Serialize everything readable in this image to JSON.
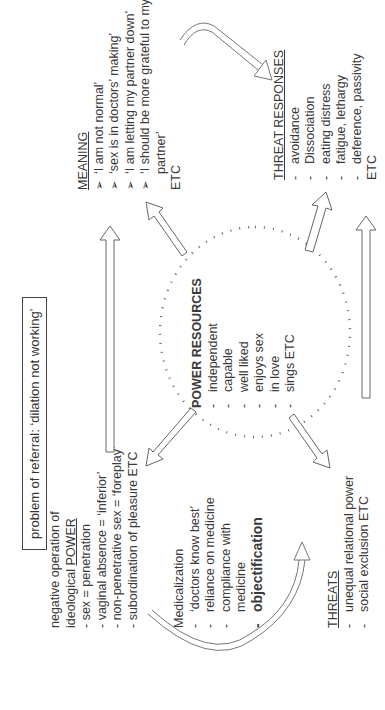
{
  "title": "problem of referral: ‘dilation not working’",
  "power": {
    "heading_line1": "negative operation of",
    "heading_line2_prefix": "ideological ",
    "heading_line2_underlined": "POWER",
    "items": [
      "- sex = penetration",
      "- vaginal absence = ‘inferior’",
      "- non-penetrative sex = ‘foreplay’",
      "- subordination of pleasure ETC"
    ]
  },
  "medicalization": {
    "heading": "Medicalization",
    "items": [
      "‘doctors know best’",
      "reliance on medicine",
      "compliance with medicine",
      "objectification"
    ]
  },
  "threats": {
    "heading": "THREATS",
    "items": [
      "unequal relational power",
      "social exclusion ETC"
    ]
  },
  "power_resources": {
    "heading": "POWER RESOURCES",
    "items": [
      "independent",
      "capable",
      "well liked",
      "enjoys sex",
      "in love",
      "sings ETC"
    ]
  },
  "meaning": {
    "heading": "MEANING",
    "items": [
      "‘I am not normal’",
      "‘sex is in doctors’ making’",
      "‘I am letting my partner down’",
      "‘I should be more grateful to my partner’"
    ],
    "footer": "ETC"
  },
  "threat_responses": {
    "heading": "THREAT RESPONSES",
    "items": [
      "avoidance",
      "Dissociation",
      "eating distress",
      "fatigue, lethargy",
      "deference, passivity"
    ],
    "footer": "ETC"
  }
}
